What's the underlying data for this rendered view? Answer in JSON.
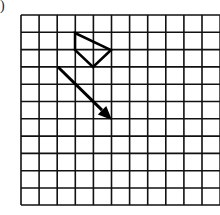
{
  "label": ")",
  "grid": {
    "origin_x": 21,
    "origin_y": 15,
    "cols": 11,
    "rows": 11,
    "cell_w": 18.1,
    "cell_h": 17.3,
    "line_color": "#111111"
  },
  "shapes": {
    "quadrilateral": {
      "points": [
        [
          75,
          33
        ],
        [
          111,
          50
        ],
        [
          93,
          67
        ],
        [
          75,
          50
        ]
      ],
      "stroke": "#000000"
    },
    "arrow": {
      "from": [
        58,
        67
      ],
      "to": [
        112,
        120
      ],
      "stroke": "#000000"
    }
  }
}
